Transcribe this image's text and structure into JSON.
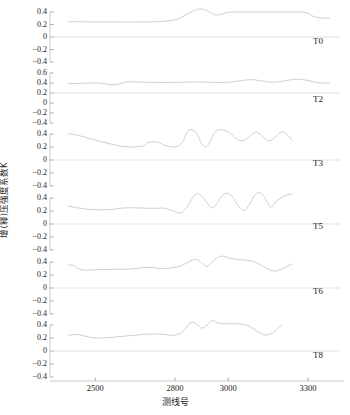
{
  "chart_data": {
    "type": "line",
    "title": "",
    "xlabel": "测线号",
    "ylabel": "增(释)压强度系数K",
    "xlim": [
      2330,
      3420
    ],
    "xticks": [
      2500,
      2800,
      3000,
      3300
    ],
    "xticklabels": [
      "2500",
      "2800",
      "3000",
      "3300"
    ],
    "grid": false,
    "legend_position": "right-inside",
    "panels": [
      {
        "name": "T0",
        "label": "T0",
        "ylim": [
          -0.5,
          0.5
        ],
        "yticks": [
          0.4,
          0.2,
          0,
          -0.2,
          -0.4
        ],
        "yticklabels": [
          "0.4",
          "0.2",
          "0",
          "−0.2",
          "−0.4"
        ],
        "zero_line": 0,
        "x": [
          2400,
          2450,
          2500,
          2550,
          2600,
          2650,
          2700,
          2750,
          2800,
          2830,
          2860,
          2880,
          2900,
          2920,
          2940,
          2960,
          2980,
          3000,
          3050,
          3100,
          3150,
          3200,
          3250,
          3280,
          3300,
          3320,
          3350,
          3380
        ],
        "y": [
          0.245,
          0.243,
          0.242,
          0.241,
          0.24,
          0.24,
          0.241,
          0.248,
          0.275,
          0.33,
          0.4,
          0.44,
          0.448,
          0.42,
          0.375,
          0.35,
          0.372,
          0.395,
          0.4,
          0.4,
          0.4,
          0.4,
          0.4,
          0.398,
          0.38,
          0.33,
          0.305,
          0.3
        ]
      },
      {
        "name": "T2",
        "label": "T2",
        "ylim": [
          -0.5,
          0.7
        ],
        "yticks": [
          0.6,
          0.4,
          0.2,
          0,
          -0.2,
          -0.4
        ],
        "yticklabels": [
          "0.6",
          "0.4",
          "0.2",
          "0",
          "−0.2",
          "−0.4"
        ],
        "zero_line": 0.2,
        "x": [
          2400,
          2450,
          2500,
          2530,
          2560,
          2590,
          2620,
          2660,
          2700,
          2760,
          2820,
          2880,
          2920,
          2960,
          3000,
          3040,
          3080,
          3110,
          3140,
          3170,
          3200,
          3230,
          3260,
          3300,
          3340,
          3380
        ],
        "y": [
          0.385,
          0.395,
          0.4,
          0.39,
          0.362,
          0.38,
          0.425,
          0.418,
          0.415,
          0.412,
          0.415,
          0.42,
          0.418,
          0.412,
          0.415,
          0.44,
          0.468,
          0.455,
          0.43,
          0.415,
          0.432,
          0.46,
          0.478,
          0.45,
          0.405,
          0.4
        ]
      },
      {
        "name": "T3",
        "label": "T3",
        "ylim": [
          -0.5,
          0.5
        ],
        "yticks": [
          0.4,
          0.2,
          0,
          -0.2,
          -0.4
        ],
        "yticklabels": [
          "0.4",
          "0.2",
          "0",
          "−0.2",
          "−0.4"
        ],
        "zero_line": 0,
        "x": [
          2400,
          2440,
          2480,
          2520,
          2560,
          2600,
          2640,
          2680,
          2700,
          2720,
          2740,
          2760,
          2790,
          2810,
          2830,
          2845,
          2860,
          2880,
          2900,
          2915,
          2930,
          2950,
          2975,
          3000,
          3020,
          3040,
          3060,
          3080,
          3100,
          3120,
          3140,
          3160,
          3180,
          3200,
          3220,
          3240
        ],
        "y": [
          0.405,
          0.375,
          0.33,
          0.285,
          0.245,
          0.21,
          0.2,
          0.215,
          0.27,
          0.28,
          0.27,
          0.225,
          0.205,
          0.21,
          0.29,
          0.42,
          0.47,
          0.42,
          0.25,
          0.2,
          0.27,
          0.43,
          0.465,
          0.43,
          0.36,
          0.305,
          0.305,
          0.36,
          0.43,
          0.4,
          0.32,
          0.3,
          0.365,
          0.43,
          0.395,
          0.3
        ]
      },
      {
        "name": "T5",
        "label": "T5",
        "ylim": [
          -0.5,
          0.5
        ],
        "yticks": [
          0.4,
          0.2,
          0,
          -0.2,
          -0.4
        ],
        "yticklabels": [
          "0.4",
          "0.2",
          "0",
          "−0.2",
          "−0.4"
        ],
        "zero_line": 0,
        "x": [
          2400,
          2440,
          2480,
          2520,
          2560,
          2600,
          2640,
          2680,
          2720,
          2760,
          2790,
          2820,
          2840,
          2860,
          2880,
          2900,
          2920,
          2940,
          2960,
          2980,
          3000,
          3020,
          3040,
          3060,
          3080,
          3100,
          3120,
          3140,
          3160,
          3180,
          3210,
          3240
        ],
        "y": [
          0.275,
          0.245,
          0.225,
          0.218,
          0.222,
          0.245,
          0.25,
          0.245,
          0.24,
          0.245,
          0.205,
          0.17,
          0.23,
          0.36,
          0.465,
          0.43,
          0.33,
          0.245,
          0.33,
          0.45,
          0.47,
          0.395,
          0.265,
          0.205,
          0.305,
          0.45,
          0.48,
          0.39,
          0.255,
          0.35,
          0.43,
          0.465
        ]
      },
      {
        "name": "T6",
        "label": "T6",
        "ylim": [
          -0.5,
          0.5
        ],
        "yticks": [
          0.4,
          0.2,
          0,
          -0.2,
          -0.4
        ],
        "yticklabels": [
          "0.4",
          "0.2",
          "0",
          "−0.2",
          "−0.4"
        ],
        "zero_line": 0,
        "x": [
          2400,
          2420,
          2440,
          2470,
          2500,
          2540,
          2580,
          2620,
          2660,
          2700,
          2740,
          2770,
          2800,
          2830,
          2860,
          2880,
          2900,
          2920,
          2940,
          2960,
          2980,
          3000,
          3030,
          3060,
          3090,
          3120,
          3150,
          3180,
          3210,
          3240
        ],
        "y": [
          0.355,
          0.345,
          0.29,
          0.275,
          0.28,
          0.285,
          0.288,
          0.29,
          0.305,
          0.32,
          0.3,
          0.305,
          0.318,
          0.355,
          0.42,
          0.44,
          0.39,
          0.33,
          0.4,
          0.47,
          0.49,
          0.465,
          0.44,
          0.43,
          0.415,
          0.36,
          0.29,
          0.26,
          0.31,
          0.37
        ]
      },
      {
        "name": "T8",
        "label": "T8",
        "ylim": [
          -0.5,
          0.5
        ],
        "yticks": [
          0.4,
          0.2,
          0,
          -0.2,
          -0.4
        ],
        "yticklabels": [
          "0.4",
          "0.2",
          "0",
          "−0.2",
          "−0.4"
        ],
        "zero_line": 0,
        "x": [
          2400,
          2430,
          2460,
          2490,
          2520,
          2560,
          2600,
          2640,
          2680,
          2720,
          2760,
          2790,
          2820,
          2840,
          2860,
          2880,
          2900,
          2920,
          2940,
          2960,
          2990,
          3020,
          3050,
          3080,
          3110,
          3140,
          3170,
          3200
        ],
        "y": [
          0.24,
          0.255,
          0.23,
          0.205,
          0.2,
          0.21,
          0.225,
          0.24,
          0.255,
          0.262,
          0.255,
          0.24,
          0.27,
          0.345,
          0.44,
          0.42,
          0.35,
          0.4,
          0.47,
          0.43,
          0.42,
          0.42,
          0.415,
          0.38,
          0.3,
          0.245,
          0.29,
          0.4
        ]
      }
    ]
  },
  "colors": {
    "trace": "#c9c9c9",
    "axis": "#b4b4b4",
    "text": "#1a1a1a",
    "background": "#ffffff"
  }
}
